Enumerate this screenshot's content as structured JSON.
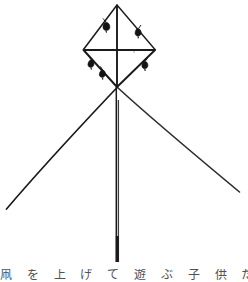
{
  "figure": {
    "type": "line-illustration",
    "background_color": "#ffffff",
    "ink_color": "#1a1a1a",
    "width": 248,
    "height": 282
  },
  "kite": {
    "frame": {
      "apex": {
        "x": 117,
        "y": 5
      },
      "left_vertex": {
        "x": 83,
        "y": 50
      },
      "right_vertex": {
        "x": 155,
        "y": 50
      },
      "bottom_vertex": {
        "x": 117,
        "y": 87
      },
      "crossbar_y": 50,
      "spine_label": "vertical-spine",
      "crossbar_label": "horizontal-crossbar"
    },
    "tassels": [
      {
        "id": 1,
        "edge": "upper-left",
        "x": 107,
        "y": 24,
        "anchor_x": 103,
        "anchor_y": 19
      },
      {
        "id": 2,
        "edge": "upper-right",
        "x": 137,
        "y": 31,
        "anchor_x": 140,
        "anchor_y": 26
      },
      {
        "id": 3,
        "edge": "lower-left",
        "x": 92,
        "y": 63,
        "anchor_x": 89,
        "anchor_y": 57
      },
      {
        "id": 4,
        "edge": "lower-left",
        "x": 103,
        "y": 73,
        "anchor_x": 100,
        "anchor_y": 67
      },
      {
        "id": 5,
        "edge": "lower-right",
        "x": 144,
        "y": 64,
        "anchor_x": 147,
        "anchor_y": 59
      }
    ],
    "tail": {
      "top": {
        "x": 117,
        "y": 87
      },
      "bottom": {
        "x": 117,
        "y": 262
      },
      "style": "thick-double-line"
    },
    "bridle_lines": [
      {
        "id": "left-sweep",
        "from_x": 117,
        "from_y": 87,
        "to_x": 6,
        "to_y": 209
      },
      {
        "id": "right-sweep",
        "from_x": 117,
        "from_y": 87,
        "to_x": 240,
        "to_y": 192
      }
    ]
  },
  "caption": {
    "text": "凧 を 上 げ て 遊 ぶ 子 供 た",
    "note": "row of characters cropped by the bottom edge"
  }
}
